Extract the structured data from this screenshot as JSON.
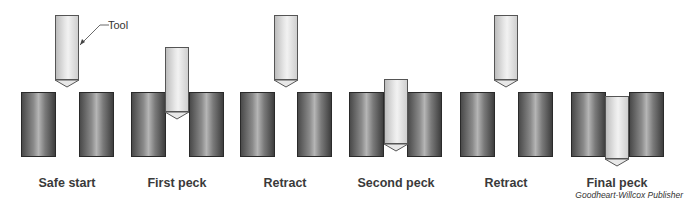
{
  "figure": {
    "callout_label": "Tool",
    "credit": "Goodheart-Willcox Publisher",
    "colors": {
      "workpiece": "#7a7a7a",
      "tool": "#e0e0e0",
      "outline": "#2a2a2a"
    }
  },
  "steps": [
    {
      "label": "Safe start",
      "center_x": 67,
      "tool_top": 15,
      "tool_bottom": 80
    },
    {
      "label": "First peck",
      "center_x": 177,
      "tool_top": 47,
      "tool_bottom": 112
    },
    {
      "label": "Retract",
      "center_x": 285,
      "tool_top": 15,
      "tool_bottom": 80
    },
    {
      "label": "Second peck",
      "center_x": 396,
      "tool_top": 79,
      "tool_bottom": 144
    },
    {
      "label": "Retract",
      "center_x": 506,
      "tool_top": 15,
      "tool_bottom": 80
    },
    {
      "label": "Final peck",
      "center_x": 617,
      "tool_top": 96,
      "tool_bottom": 161
    }
  ]
}
